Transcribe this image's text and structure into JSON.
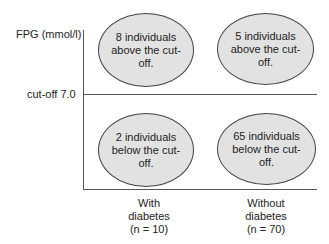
{
  "y_axis_label": "FPG (mmol/l)",
  "cutoff_label": "cut-off  7.0",
  "cells": {
    "with_above": "8 individuals above the cut-off.",
    "without_above": "5 individuals above the cut-off.",
    "with_below": "2 individuals below the cut-off.",
    "without_below": "65 individuals below the cut-off."
  },
  "columns": {
    "with": {
      "line1": "With",
      "line2": "diabetes",
      "line3": "(n = 10)"
    },
    "without": {
      "line1": "Without",
      "line2": "diabetes",
      "line3": "(n = 70)"
    }
  },
  "colors": {
    "ellipse_fill": "#e2e2e2",
    "line": "#555555"
  }
}
